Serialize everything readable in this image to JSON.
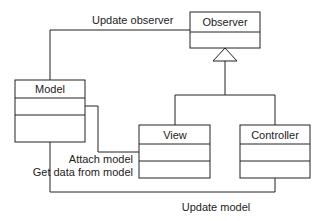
{
  "diagram": {
    "type": "UML class diagram (Model-View-Controller / Observer)",
    "classes": [
      {
        "id": "observer",
        "name": "Observer"
      },
      {
        "id": "model",
        "name": "Model"
      },
      {
        "id": "view",
        "name": "View"
      },
      {
        "id": "controller",
        "name": "Controller"
      }
    ],
    "labels": {
      "update_observer": "Update observer",
      "attach_model": "Attach model",
      "get_data": "Get data from model",
      "update_model": "Update model"
    },
    "relations": [
      {
        "from": "model",
        "to": "observer",
        "kind": "association",
        "label": "Update observer"
      },
      {
        "from": "view",
        "to": "observer",
        "kind": "generalization"
      },
      {
        "from": "controller",
        "to": "observer",
        "kind": "generalization"
      },
      {
        "from": "view",
        "to": "model",
        "kind": "association",
        "label": "Attach model / Get data from model"
      },
      {
        "from": "controller",
        "to": "model",
        "kind": "association",
        "label": "Update model"
      }
    ]
  }
}
